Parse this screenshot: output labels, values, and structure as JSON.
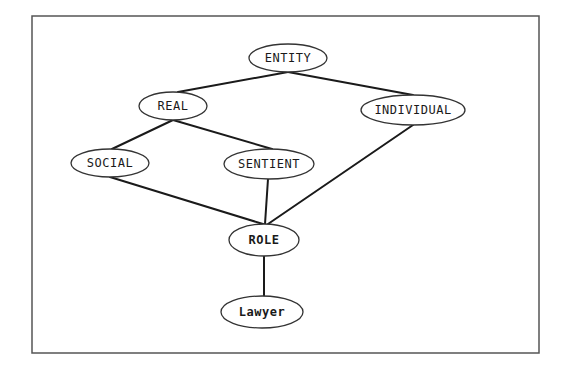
{
  "diagram": {
    "frame": {
      "x": 32,
      "y": 16,
      "width": 507,
      "height": 337
    },
    "colors": {
      "line": "#1a1a1a",
      "node_border": "#333333",
      "frame": "#555555",
      "background": "#ffffff"
    },
    "nodes": [
      {
        "id": "entity",
        "label": "ENTITY",
        "cx": 288,
        "cy": 58,
        "rx": 39,
        "ry": 14,
        "bold": false
      },
      {
        "id": "real",
        "label": "REAL",
        "cx": 173,
        "cy": 106,
        "rx": 34,
        "ry": 14,
        "bold": false
      },
      {
        "id": "individual",
        "label": "INDIVIDUAL",
        "cx": 413,
        "cy": 110,
        "rx": 52,
        "ry": 15,
        "bold": false
      },
      {
        "id": "social",
        "label": "SOCIAL",
        "cx": 110,
        "cy": 163,
        "rx": 39,
        "ry": 14,
        "bold": false
      },
      {
        "id": "sentient",
        "label": "SENTIENT",
        "cx": 269,
        "cy": 164,
        "rx": 45,
        "ry": 15,
        "bold": false
      },
      {
        "id": "role",
        "label": "ROLE",
        "cx": 264,
        "cy": 240,
        "rx": 35,
        "ry": 16,
        "bold": true
      },
      {
        "id": "lawyer",
        "label": "Lawyer",
        "cx": 262,
        "cy": 312,
        "rx": 41,
        "ry": 16,
        "bold": true
      }
    ],
    "edges": [
      {
        "from": "entity",
        "to": "real",
        "x1": 288,
        "y1": 72,
        "x2": 178,
        "y2": 92
      },
      {
        "from": "entity",
        "to": "individual",
        "x1": 288,
        "y1": 72,
        "x2": 413,
        "y2": 95
      },
      {
        "from": "real",
        "to": "social",
        "x1": 173,
        "y1": 120,
        "x2": 112,
        "y2": 149
      },
      {
        "from": "real",
        "to": "sentient",
        "x1": 173,
        "y1": 120,
        "x2": 272,
        "y2": 149
      },
      {
        "from": "social",
        "to": "role",
        "x1": 110,
        "y1": 177,
        "x2": 263,
        "y2": 224
      },
      {
        "from": "sentient",
        "to": "role",
        "x1": 268,
        "y1": 179,
        "x2": 265,
        "y2": 224
      },
      {
        "from": "individual",
        "to": "role",
        "x1": 413,
        "y1": 125,
        "x2": 268,
        "y2": 224
      },
      {
        "from": "role",
        "to": "lawyer",
        "x1": 264,
        "y1": 256,
        "x2": 264,
        "y2": 296
      }
    ]
  }
}
